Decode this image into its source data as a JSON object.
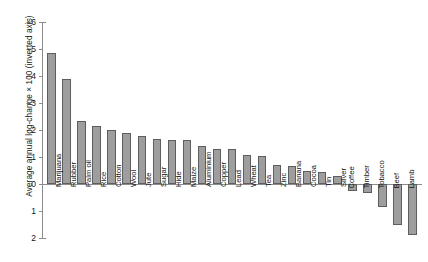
{
  "chart_data": {
    "type": "bar",
    "title": "",
    "subtitle": "",
    "xlabel": "",
    "ylabel": "Average annual log-change × 100 (inverted axis)",
    "orientation": "vertical",
    "inverted_yaxis": true,
    "grid": false,
    "legend": null,
    "ylim": [
      -6,
      2
    ],
    "ytick_labels": [
      "−6",
      "−5",
      "−4",
      "−3",
      "−2",
      "−1",
      "0",
      "1",
      "2"
    ],
    "ytick_values": [
      -6,
      -5,
      -4,
      -3,
      -2,
      -1,
      0,
      1,
      2
    ],
    "categories": [
      "Marijuana",
      "Rubber",
      "Palm oil",
      "Rice",
      "Cotton",
      "Wool",
      "Jute",
      "Sugar",
      "Hide",
      "Maize",
      "Aluminium",
      "Copper",
      "Lead",
      "Wheat",
      "Tea",
      "Zinc",
      "Banana",
      "Cocoa",
      "Tin",
      "Silver",
      "Coffee",
      "Timber",
      "Tobacco",
      "Beef",
      "Lamb"
    ],
    "values": [
      -4.85,
      -3.88,
      -2.35,
      -2.15,
      -2.0,
      -1.9,
      -1.78,
      -1.68,
      -1.62,
      -1.62,
      -1.42,
      -1.3,
      -1.28,
      -1.08,
      -1.02,
      -0.72,
      -0.68,
      -0.48,
      -0.45,
      -0.3,
      0.25,
      0.33,
      0.85,
      1.52,
      1.9
    ],
    "bar_fill_color": "#9e9e9e",
    "bar_edge_color": "#5e5e5e",
    "axis_color": "#8c8c8c",
    "background_color": "#ffffff"
  },
  "axis": {
    "y_title": "Average annual log-change × 100 (inverted axis)"
  }
}
